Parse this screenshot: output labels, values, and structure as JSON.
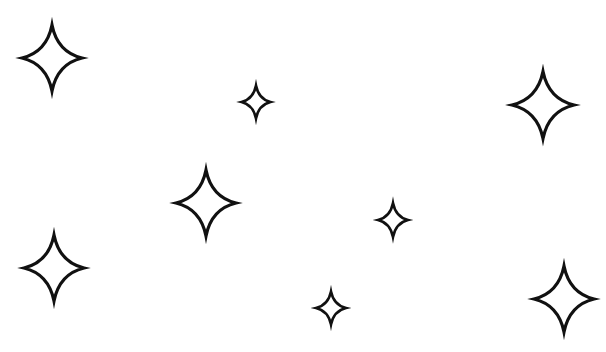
{
  "canvas": {
    "width": 606,
    "height": 352,
    "background": "#ffffff"
  },
  "style": {
    "stroke_color": "#111111",
    "fill_color": "#ffffff"
  },
  "sparkles": [
    {
      "name": "sparkle-large-top-left",
      "cx": 52,
      "cy": 58,
      "w": 60,
      "h": 66,
      "stroke": 3.2
    },
    {
      "name": "sparkle-small-top-center",
      "cx": 256,
      "cy": 102,
      "w": 29,
      "h": 33,
      "stroke": 2.6
    },
    {
      "name": "sparkle-large-top-right",
      "cx": 543,
      "cy": 105,
      "w": 62,
      "h": 67,
      "stroke": 3.2
    },
    {
      "name": "sparkle-large-middle-left",
      "cx": 206,
      "cy": 203,
      "w": 60,
      "h": 66,
      "stroke": 3.2
    },
    {
      "name": "sparkle-small-middle-right",
      "cx": 393,
      "cy": 220,
      "w": 30,
      "h": 34,
      "stroke": 2.6
    },
    {
      "name": "sparkle-large-bottom-left",
      "cx": 54,
      "cy": 268,
      "w": 60,
      "h": 66,
      "stroke": 3.2
    },
    {
      "name": "sparkle-small-bottom-center",
      "cx": 331,
      "cy": 308,
      "w": 30,
      "h": 33,
      "stroke": 2.6
    },
    {
      "name": "sparkle-large-bottom-right",
      "cx": 564,
      "cy": 299,
      "w": 60,
      "h": 66,
      "stroke": 3.2
    }
  ]
}
